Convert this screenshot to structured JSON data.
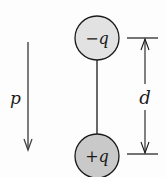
{
  "diagram": {
    "type": "electric-dipole",
    "charges": [
      {
        "label": "−q",
        "sign": "negative",
        "fill": "#e2e2e2",
        "position": "top"
      },
      {
        "label": "+q",
        "sign": "positive",
        "fill": "#c9c9c9",
        "position": "bottom"
      }
    ],
    "separation_label": "d",
    "dipole_moment_label": "p",
    "dipole_moment_direction": "down",
    "colors": {
      "stroke": "#1a1a1a",
      "negative_fill": "#e2e2e2",
      "positive_fill": "#c9c9c9",
      "background": "#fdfdfd"
    }
  }
}
